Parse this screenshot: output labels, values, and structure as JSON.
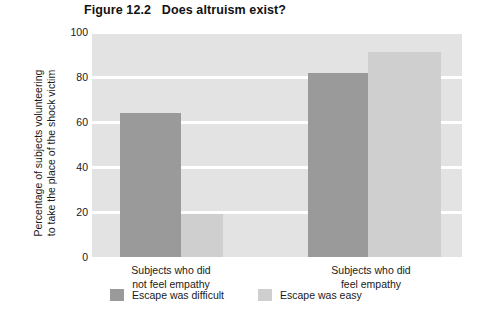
{
  "figure": {
    "title": "Figure 12.2   Does altruism exist?"
  },
  "chart_data": {
    "type": "bar",
    "title": "Figure 12.2   Does altruism exist?",
    "xlabel": "",
    "ylabel": "Percentage of subjects volunteering to take the place of the shock victim",
    "ylabel_lines": [
      "Percentage of subjects volunteering",
      "to take the place of the shock victim"
    ],
    "categories": [
      "Subjects who did not feel empathy",
      "Subjects who did feel empathy"
    ],
    "category_lines": [
      [
        "Subjects who did",
        "not feel empathy"
      ],
      [
        "Subjects who did",
        "feel empathy"
      ]
    ],
    "series": [
      {
        "name": "Escape was difficult",
        "color": "#9a9a9a",
        "values": [
          64,
          82
        ]
      },
      {
        "name": "Escape was easy",
        "color": "#cfcfcf",
        "values": [
          19,
          91
        ]
      }
    ],
    "ylim": [
      0,
      100
    ],
    "yticks": [
      100,
      80,
      60,
      40,
      20,
      0
    ],
    "ytick_labels": [
      "100",
      "80",
      "60",
      "40",
      "20",
      "0"
    ],
    "grid": true,
    "grid_color": "#ffffff",
    "plot_background": "#e3e3e3",
    "legend_position": "bottom-left"
  }
}
